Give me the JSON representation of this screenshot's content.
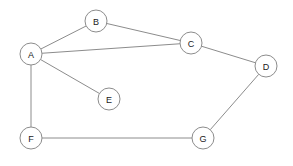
{
  "diagram": {
    "type": "undirected-graph",
    "title": "",
    "background_color": "#ffffff",
    "edge_color": "#8c8c8c",
    "node_fill_color": "#ffffff",
    "node_stroke_color": "#8c8c8c",
    "label_color": "#1a1a1a",
    "node_radius": 11,
    "width": 293,
    "height": 166,
    "nodes": [
      {
        "id": "A",
        "label": "A",
        "x": 31,
        "y": 54,
        "degree": 4
      },
      {
        "id": "B",
        "label": "B",
        "x": 96,
        "y": 21,
        "degree": 2
      },
      {
        "id": "C",
        "label": "C",
        "x": 191,
        "y": 43,
        "degree": 3
      },
      {
        "id": "D",
        "label": "D",
        "x": 266,
        "y": 66,
        "degree": 2
      },
      {
        "id": "E",
        "label": "E",
        "x": 109,
        "y": 99,
        "degree": 1
      },
      {
        "id": "F",
        "label": "F",
        "x": 31,
        "y": 138,
        "degree": 2
      },
      {
        "id": "G",
        "label": "G",
        "x": 203,
        "y": 138,
        "degree": 2
      }
    ],
    "edges": [
      {
        "from": "A",
        "to": "B",
        "x1": 31,
        "y1": 54,
        "x2": 96,
        "y2": 21
      },
      {
        "from": "A",
        "to": "C",
        "x1": 31,
        "y1": 54,
        "x2": 191,
        "y2": 43
      },
      {
        "from": "A",
        "to": "E",
        "x1": 31,
        "y1": 54,
        "x2": 109,
        "y2": 99
      },
      {
        "from": "A",
        "to": "F",
        "x1": 31,
        "y1": 54,
        "x2": 31,
        "y2": 138
      },
      {
        "from": "B",
        "to": "C",
        "x1": 96,
        "y1": 21,
        "x2": 191,
        "y2": 43
      },
      {
        "from": "C",
        "to": "D",
        "x1": 191,
        "y1": 43,
        "x2": 266,
        "y2": 66
      },
      {
        "from": "D",
        "to": "G",
        "x1": 266,
        "y1": 66,
        "x2": 203,
        "y2": 138
      },
      {
        "from": "F",
        "to": "G",
        "x1": 31,
        "y1": 138,
        "x2": 203,
        "y2": 138
      }
    ]
  }
}
